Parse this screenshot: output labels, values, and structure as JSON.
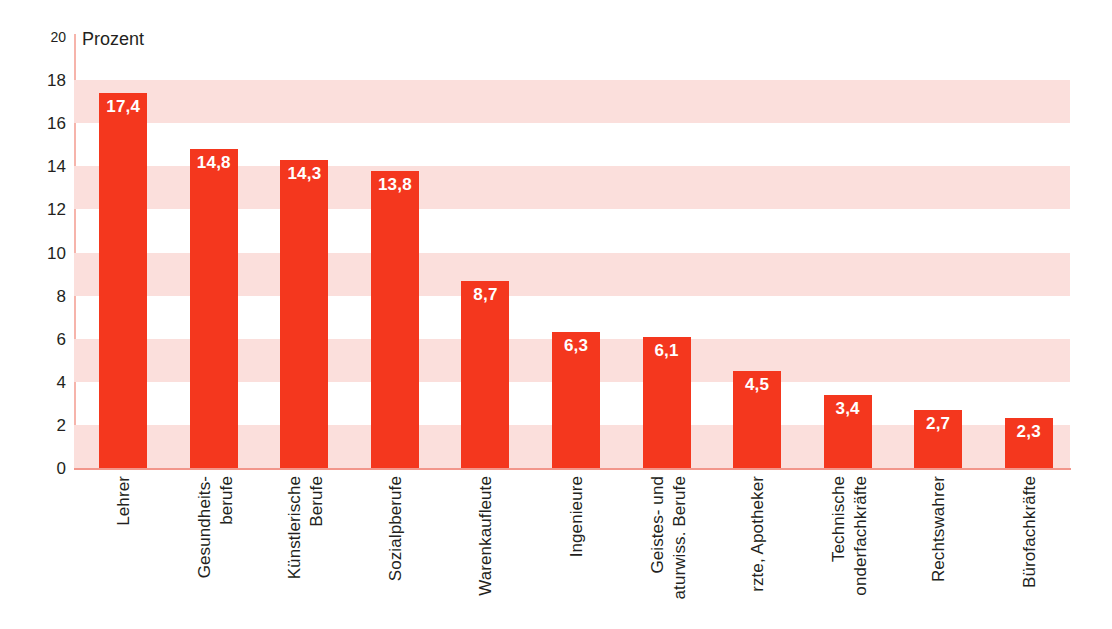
{
  "chart_data": {
    "type": "bar",
    "title": "",
    "subtitle": "",
    "xlabel": "",
    "ylabel": "Prozent",
    "unit_label": "Prozent",
    "ylim": [
      0,
      20
    ],
    "ytick_step": 2,
    "ytick_labels": [
      "20",
      "18",
      "16",
      "14",
      "12",
      "10",
      "8",
      "6",
      "4",
      "2",
      "0"
    ],
    "grid": "alternating horizontal bands",
    "legend": "none",
    "bar_color": "#f4371e",
    "band_color": "#fbdfdc",
    "axis_color": "#f2968b",
    "value_label_color": "#ffffff",
    "decimal_separator": ",",
    "categories": [
      "Lehrer",
      "Gesundheits-berufe",
      "Künstlerische Berufe",
      "Sozialpberufe",
      "Warenkaufleute",
      "Ingenieure",
      "Geistes- und aturwiss. Berufe",
      "rzte, Apotheker",
      "Technische onderfachkräfte",
      "Rechtswahrer",
      "Bürofachkräfte"
    ],
    "category_lines": [
      [
        "Lehrer"
      ],
      [
        "Gesundheits-",
        "berufe"
      ],
      [
        "Künstlerische",
        "Berufe"
      ],
      [
        "Sozialpberufe"
      ],
      [
        "Warenkaufleute"
      ],
      [
        "Ingenieure"
      ],
      [
        "Geistes- und",
        "aturwiss. Berufe"
      ],
      [
        "rzte, Apotheker"
      ],
      [
        "Technische",
        "onderfachkräfte"
      ],
      [
        "Rechtswahrer"
      ],
      [
        "Bürofachkräfte"
      ]
    ],
    "values": [
      17.4,
      14.8,
      14.3,
      13.8,
      8.7,
      6.3,
      6.1,
      4.5,
      3.4,
      2.7,
      2.3
    ],
    "value_labels": [
      "17,4",
      "14,8",
      "14,3",
      "13,8",
      "8,7",
      "6,3",
      "6,1",
      "4,5",
      "3,4",
      "2,7",
      "2,3"
    ]
  }
}
